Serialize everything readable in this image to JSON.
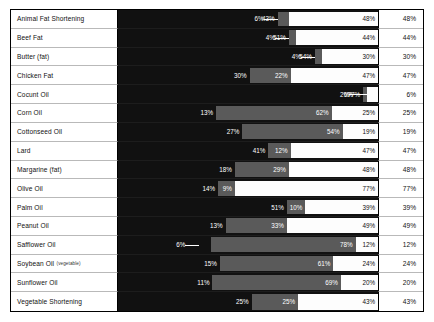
{
  "chart_data": {
    "type": "bar",
    "subtype": "stacked-horizontal",
    "title": "",
    "xlabel": "",
    "ylabel": "",
    "grid": false,
    "legend": [
      {
        "name": "Saturated fat",
        "color": "#111111"
      },
      {
        "name": "Mono-unsaturated fat",
        "color": "#5a5a5a"
      },
      {
        "name": "Poly-unsaturated fat",
        "color": "#fdfdfd"
      }
    ],
    "legend_position": "none",
    "xlim": [
      0,
      100
    ],
    "categories": [
      "Animal Fat Shortening",
      "Beef Fat",
      "Butter (fat)",
      "Chicken Fat",
      "Cocunt Oil",
      "Corn Oil",
      "Cottonseed Oil",
      "Lard",
      "Margarine (fat)",
      "Olive Oil",
      "Palm Oil",
      "Peanut Oil",
      "Safflower Oil",
      "Soybean Oil",
      "Sunflower Oil",
      "Vegetable Shortening"
    ],
    "series": [
      {
        "name": "Saturated fat",
        "values": [
          43,
          51,
          54,
          30,
          77,
          13,
          27,
          41,
          18,
          14,
          51,
          13,
          6,
          15,
          11,
          25
        ]
      },
      {
        "name": "Mono-unsaturated fat",
        "values": [
          6,
          4,
          4,
          22,
          2,
          62,
          54,
          12,
          29,
          9,
          10,
          33,
          78,
          61,
          69,
          25
        ]
      },
      {
        "name": "Poly-unsaturated fat",
        "values": [
          48,
          44,
          30,
          47,
          6,
          25,
          19,
          47,
          48,
          77,
          39,
          49,
          12,
          24,
          20,
          43
        ]
      }
    ],
    "right_column_label": "",
    "right_column_values": [
      "48%",
      "44%",
      "30%",
      "47%",
      "6%",
      "25%",
      "19%",
      "47%",
      "48%",
      "77%",
      "39%",
      "49%",
      "12%",
      "24%",
      "20%",
      "43%"
    ]
  },
  "rows": [
    {
      "label": "Animal Fat Shortening",
      "sub": "",
      "sat": "43%",
      "mono": "6%",
      "poly": "48%",
      "value": "48%",
      "sat_pct": 43,
      "mono_pct": 6,
      "poly_pct": 48
    },
    {
      "label": "Beef Fat",
      "sub": "",
      "sat": "51%",
      "mono": "4%",
      "poly": "44%",
      "value": "44%",
      "sat_pct": 51,
      "mono_pct": 4,
      "poly_pct": 44
    },
    {
      "label": "Butter (fat)",
      "sub": "",
      "sat": "54%",
      "mono": "4%",
      "poly": "30%",
      "value": "30%",
      "sat_pct": 54,
      "mono_pct": 4,
      "poly_pct": 30
    },
    {
      "label": "Chicken Fat",
      "sub": "",
      "sat": "30%",
      "mono": "22%",
      "poly": "47%",
      "value": "47%",
      "sat_pct": 30,
      "mono_pct": 22,
      "poly_pct": 47
    },
    {
      "label": "Cocunt Oil",
      "sub": "",
      "sat": "77%",
      "mono": "2%",
      "poly": "6%",
      "value": "6%",
      "sat_pct": 77,
      "mono_pct": 2,
      "poly_pct": 6
    },
    {
      "label": "Corn Oil",
      "sub": "",
      "sat": "13%",
      "mono": "62%",
      "poly": "25%",
      "value": "25%",
      "sat_pct": 13,
      "mono_pct": 62,
      "poly_pct": 25
    },
    {
      "label": "Cottonseed Oil",
      "sub": "",
      "sat": "27%",
      "mono": "54%",
      "poly": "19%",
      "value": "19%",
      "sat_pct": 27,
      "mono_pct": 54,
      "poly_pct": 19
    },
    {
      "label": "Lard",
      "sub": "",
      "sat": "41%",
      "mono": "12%",
      "poly": "47%",
      "value": "47%",
      "sat_pct": 41,
      "mono_pct": 12,
      "poly_pct": 47
    },
    {
      "label": "Margarine (fat)",
      "sub": "",
      "sat": "18%",
      "mono": "29%",
      "poly": "48%",
      "value": "48%",
      "sat_pct": 18,
      "mono_pct": 29,
      "poly_pct": 48
    },
    {
      "label": "Olive Oil",
      "sub": "",
      "sat": "14%",
      "mono": "9%",
      "poly": "77%",
      "value": "77%",
      "sat_pct": 14,
      "mono_pct": 9,
      "poly_pct": 77
    },
    {
      "label": "Palm Oil",
      "sub": "",
      "sat": "51%",
      "mono": "10%",
      "poly": "39%",
      "value": "39%",
      "sat_pct": 51,
      "mono_pct": 10,
      "poly_pct": 39
    },
    {
      "label": "Peanut Oil",
      "sub": "",
      "sat": "13%",
      "mono": "33%",
      "poly": "49%",
      "value": "49%",
      "sat_pct": 13,
      "mono_pct": 33,
      "poly_pct": 49
    },
    {
      "label": "Safflower Oil",
      "sub": "",
      "sat": "6%",
      "mono": "78%",
      "poly": "12%",
      "value": "12%",
      "sat_pct": 6,
      "mono_pct": 78,
      "poly_pct": 12
    },
    {
      "label": "Soybean Oil",
      "sub": "(vegetable)",
      "sat": "15%",
      "mono": "61%",
      "poly": "24%",
      "value": "24%",
      "sat_pct": 15,
      "mono_pct": 61,
      "poly_pct": 24
    },
    {
      "label": "Sunflower Oil",
      "sub": "",
      "sat": "11%",
      "mono": "69%",
      "poly": "20%",
      "value": "20%",
      "sat_pct": 11,
      "mono_pct": 69,
      "poly_pct": 20
    },
    {
      "label": "Vegetable Shortening",
      "sub": "",
      "sat": "25%",
      "mono": "25%",
      "poly": "43%",
      "value": "43%",
      "sat_pct": 25,
      "mono_pct": 25,
      "poly_pct": 43
    }
  ]
}
